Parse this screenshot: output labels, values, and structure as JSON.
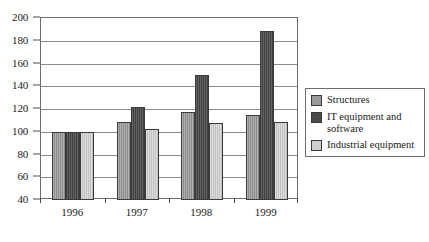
{
  "chart_data": {
    "type": "bar",
    "title": "",
    "subtitle": "",
    "xlabel": "",
    "ylabel": "",
    "categories": [
      "1996",
      "1997",
      "1998",
      "1999"
    ],
    "series": [
      {
        "name": "Structures",
        "color": "#9a9a9a",
        "values": [
          100,
          109,
          117,
          115
        ]
      },
      {
        "name": "IT equipment and software",
        "color": "#4b4b4b",
        "values": [
          100,
          122,
          150,
          189
        ]
      },
      {
        "name": "Industrial equipment",
        "color": "#cfcfcf",
        "values": [
          100,
          102,
          108,
          109
        ]
      }
    ],
    "ylim": [
      40,
      200
    ],
    "ytick_step": 20,
    "yticks": [
      40,
      60,
      80,
      100,
      120,
      140,
      160,
      180,
      200
    ],
    "ytick_labels": [
      "40",
      "60",
      "80",
      "100",
      "120",
      "140",
      "160",
      "180",
      "200"
    ],
    "grid": true,
    "grid_axis": "y",
    "legend_position": "right",
    "bar_group_gap_ratio": 0.35,
    "frame_color": "#6e6e6e",
    "gridline_color": "#8d8d8d"
  }
}
